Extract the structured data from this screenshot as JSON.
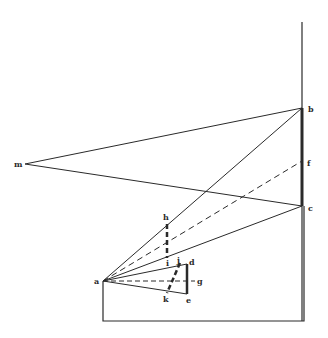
{
  "diagram": {
    "type": "geometric-perspective-construction",
    "colors": {
      "line": "#2a2a2a",
      "background": "#ffffff"
    },
    "labels": {
      "a": "a",
      "b": "b",
      "c": "c",
      "d": "d",
      "e": "e",
      "f": "f",
      "g": "g",
      "h": "h",
      "i": "i",
      "j": "j",
      "k": "k",
      "m": "m"
    },
    "points": {
      "a": [
        103,
        281
      ],
      "b": [
        302,
        108
      ],
      "c": [
        302,
        206
      ],
      "f": [
        302,
        161
      ],
      "m": [
        25,
        164
      ],
      "h": [
        167,
        224
      ],
      "i": [
        167,
        258
      ],
      "d": [
        187,
        264
      ],
      "e": [
        187,
        294
      ],
      "g": [
        187,
        281
      ],
      "j": [
        180,
        263
      ],
      "k": [
        167,
        293
      ]
    }
  }
}
